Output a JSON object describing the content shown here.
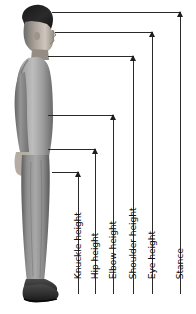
{
  "diagram": {
    "background_color": "#ffffff",
    "line_color": "#2a2a2a",
    "text_color": "#111111",
    "measurements": [
      {
        "id": "knuckle-height",
        "label": "Knuckle height",
        "vertical_line_x": 78,
        "arrow_tip_y": 172,
        "baseline_y": 294,
        "horizontal_line_from_x": 52
      },
      {
        "id": "hip-height",
        "label": "Hip height",
        "vertical_line_x": 95,
        "arrow_tip_y": 149,
        "baseline_y": 294,
        "horizontal_line_from_x": 48
      },
      {
        "id": "elbow-height",
        "label": "Elbow height",
        "vertical_line_x": 113,
        "arrow_tip_y": 115,
        "baseline_y": 294,
        "horizontal_line_from_x": 48
      },
      {
        "id": "shoulder-height",
        "label": "Shoulder height",
        "vertical_line_x": 133,
        "arrow_tip_y": 56,
        "baseline_y": 294,
        "horizontal_line_from_x": 48
      },
      {
        "id": "eye-height",
        "label": "Eye height",
        "vertical_line_x": 152,
        "arrow_tip_y": 32,
        "baseline_y": 294,
        "horizontal_line_from_x": 55
      },
      {
        "id": "stance",
        "label": "Stance",
        "vertical_line_x": 180,
        "arrow_tip_y": 12,
        "baseline_y": 294,
        "horizontal_line_from_x": 52
      }
    ]
  }
}
